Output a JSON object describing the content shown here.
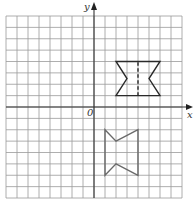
{
  "figure": {
    "type": "coordinate-grid",
    "grid": {
      "x_min": -8,
      "x_max": 8,
      "y_min": -8,
      "y_max": 8,
      "step": 1,
      "line_color": "#9a9a9a",
      "axis_color": "#333333"
    },
    "axes": {
      "x_label": "x",
      "y_label": "y",
      "origin_label": "0"
    },
    "shapes": [
      {
        "name": "bowtie-upper",
        "color": "#2a2a2a",
        "vertices": [
          [
            2,
            4
          ],
          [
            6,
            4
          ],
          [
            5,
            2.5
          ],
          [
            6,
            1
          ],
          [
            2,
            1
          ],
          [
            3,
            2.5
          ]
        ],
        "dashed_line": [
          [
            4,
            1
          ],
          [
            4,
            4
          ]
        ]
      },
      {
        "name": "bowtie-lower",
        "color": "#6a6a6a",
        "vertices": [
          [
            1,
            -2
          ],
          [
            2,
            -3
          ],
          [
            4,
            -2
          ],
          [
            4,
            -6
          ],
          [
            2,
            -5
          ],
          [
            1,
            -6
          ]
        ]
      }
    ]
  }
}
